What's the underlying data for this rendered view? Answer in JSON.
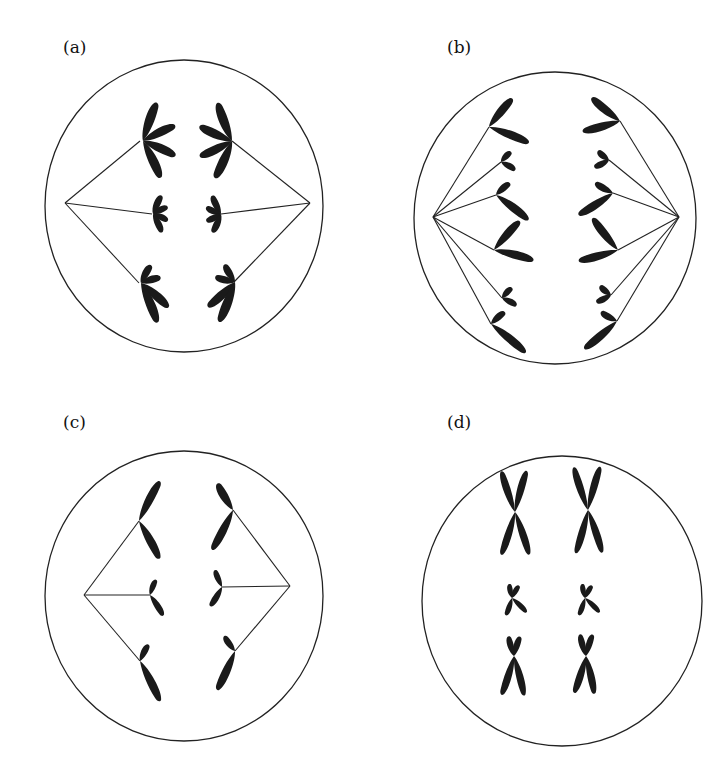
{
  "figure": {
    "type": "cell division stages diagram",
    "panels": [
      {
        "id": "a",
        "label": "(a)",
        "description": "Cell with three chromosome sets (each with 4 arms/chromatids) attached to spindle fibers from two poles; large, small, medium pairs"
      },
      {
        "id": "b",
        "label": "(b)",
        "description": "Cell with six chromosomes per side attached to spindle fibers from two poles"
      },
      {
        "id": "c",
        "label": "(c)",
        "description": "Cell with three chromosomes per side, each with two chromatids, attached to spindle from two poles"
      },
      {
        "id": "d",
        "label": "(d)",
        "description": "Cell with three pairs of X-shaped chromosomes, no spindle"
      }
    ]
  },
  "colors": {
    "stroke": "#222222",
    "chromosome": "#1a1a1a",
    "background": "#ffffff"
  }
}
